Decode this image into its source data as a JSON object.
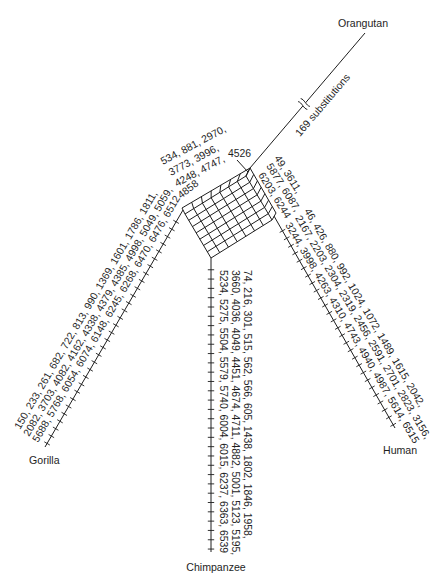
{
  "figure": {
    "taxa": {
      "orangutan": "Orangutan",
      "gorilla": "Gorilla",
      "human": "Human",
      "chimpanzee": "Chimpanzee"
    },
    "orangutan_branch": {
      "break_label": "169 substitutions",
      "substitutions": 169
    },
    "box": {
      "top_rows": [
        "534, 881, 2970,",
        "3773, 3996,",
        "4248, 4747,"
      ],
      "corner_label": "4526",
      "left_label": "4858"
    },
    "gorilla_branch": {
      "rows": [
        "150, 233, 261, 682, 722, 813, 990, 1369, 1601, 1786, 1811,",
        "2082, 3703, 4082, 4162, 4338, 4379, 4385, 4998, 5049, 5059,",
        "5688, 5768, 6054, 6074, 6148, 6245, 6268, 6470, 6476, 6512"
      ]
    },
    "human_branch": {
      "near_box_rows": [
        "49, 3611,",
        "5877, 6087,",
        "6203, 6244"
      ],
      "rows": [
        "46, 426, 880, 992, 1024, 1072, 1489, 1615, 2042,",
        "2167, 2203, 2304, 2319, 2456, 2591, 2701, 2823, 3156,",
        "3244, 3998, 4263, 4310, 4743, 4940, 4987, 5614, 6515"
      ]
    },
    "chimpanzee_branch": {
      "rows": [
        "74, 216, 301, 515, 562, 566, 605, 1438, 1802, 1846, 1958,",
        "3660, 4036, 4049, 4451, 4674, 4711, 4882, 5001, 5123, 5195,",
        "5234, 5275, 5504, 5579, 5740, 6004, 6015, 6237, 6363, 6539"
      ]
    }
  }
}
